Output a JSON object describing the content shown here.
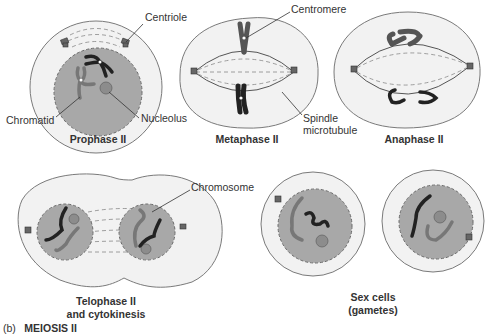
{
  "figure": {
    "caption_prefix": "(b)",
    "caption_title": "MEIOSIS II"
  },
  "stages": [
    {
      "id": "prophase-ii",
      "title_lines": [
        "Prophase II"
      ]
    },
    {
      "id": "metaphase-ii",
      "title_lines": [
        "Metaphase II"
      ]
    },
    {
      "id": "anaphase-ii",
      "title_lines": [
        "Anaphase II"
      ]
    },
    {
      "id": "telophase-ii",
      "title_lines": [
        "Telophase II",
        "and cytokinesis"
      ]
    },
    {
      "id": "sex-cells",
      "title_lines": [
        "Sex cells",
        "(gametes)"
      ]
    }
  ],
  "labels": {
    "centriole": "Centriole",
    "chromatid": "Chromatid",
    "nucleolus": "Nucleolus",
    "centromere": "Centromere",
    "spindle_line1": "Spindle",
    "spindle_line2": "microtubule",
    "chromosome": "Chromosome"
  }
}
